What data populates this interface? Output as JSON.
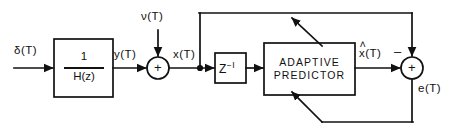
{
  "figure": {
    "type": "block-diagram",
    "background_color": "#ffffff",
    "line_color": "#111111"
  },
  "labels": {
    "input_delta": "δ(T)",
    "noise_nu": "ν(T)",
    "signal_y": "y(T)",
    "signal_x": "x(T)",
    "signal_xhat_base": "x",
    "signal_xhat_hat": "˄",
    "signal_xhat_tail": "(T)",
    "error_e": "e(T)",
    "sum1_plus": "+",
    "sum2_plus": "+",
    "sum2_minus": "–"
  },
  "blocks": [
    {
      "id": "inverse-filter",
      "numerator": "1",
      "denominator": "H(z)",
      "x": 54,
      "y": 39,
      "w": 59,
      "h": 58
    },
    {
      "id": "unit-delay",
      "label_base": "Z",
      "label_sup": "−I",
      "x": 215,
      "y": 53,
      "w": 31,
      "h": 30
    },
    {
      "id": "adaptive-predictor",
      "line1": "ADAPTIVE",
      "line2": "PREDICTOR",
      "x": 264,
      "y": 43,
      "w": 91,
      "h": 52
    }
  ],
  "summing_junctions": [
    {
      "id": "sum-noise",
      "cx": 158,
      "cy": 68,
      "r": 11,
      "symbol": "+"
    },
    {
      "id": "sum-error",
      "cx": 412,
      "cy": 68,
      "r": 11,
      "symbol": "+"
    }
  ],
  "nodes": [
    {
      "id": "x-tap",
      "cx": 200,
      "cy": 68
    }
  ]
}
